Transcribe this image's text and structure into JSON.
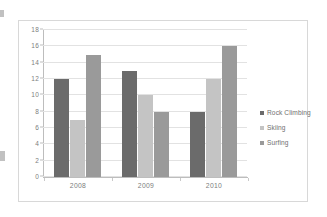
{
  "chart_data": {
    "type": "bar",
    "title": "",
    "subtitle": "",
    "xlabel": "",
    "ylabel": "",
    "categories": [
      "2008",
      "2009",
      "2010"
    ],
    "series": [
      {
        "name": "Rock Climbing",
        "color": "#6b6b6b",
        "values": [
          12,
          13,
          8
        ]
      },
      {
        "name": "Skiing",
        "color": "#c4c4c4",
        "values": [
          7,
          10,
          12
        ]
      },
      {
        "name": "Surfing",
        "color": "#9a9a9a",
        "values": [
          15,
          8,
          16
        ]
      }
    ],
    "ylim": [
      0,
      18
    ],
    "ytick_step": 2,
    "yticks": [
      0,
      2,
      4,
      6,
      8,
      10,
      12,
      14,
      16,
      18
    ],
    "ytick_labels": [
      "0",
      "2",
      "4",
      "6",
      "8",
      "10",
      "12",
      "14",
      "16",
      "18"
    ],
    "grid": true,
    "grid_axis": "y",
    "legend": true,
    "legend_position": "right",
    "bar_mode": "grouped"
  },
  "frame": {
    "border_color": "#d8d8d8",
    "background": "#ffffff"
  }
}
